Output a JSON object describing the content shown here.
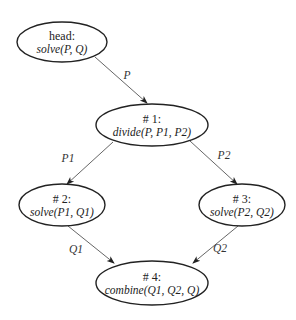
{
  "diagram": {
    "type": "flow-graph",
    "nodes": [
      {
        "id": "head",
        "title": "head:",
        "label": "solve(P, Q)",
        "cx": 62,
        "cy": 42,
        "rx": 45,
        "ry": 20
      },
      {
        "id": "n1",
        "title": "# 1:",
        "label": "divide(P, P1, P2)",
        "cx": 152,
        "cy": 125,
        "rx": 56,
        "ry": 21
      },
      {
        "id": "n2",
        "title": "# 2:",
        "label": "solve(P1, Q1)",
        "cx": 62,
        "cy": 205,
        "rx": 43,
        "ry": 21
      },
      {
        "id": "n3",
        "title": "# 3:",
        "label": "solve(P2, Q2)",
        "cx": 242,
        "cy": 205,
        "rx": 43,
        "ry": 21
      },
      {
        "id": "n4",
        "title": "# 4:",
        "label": "combine(Q1, Q2, Q)",
        "cx": 152,
        "cy": 283,
        "rx": 56,
        "ry": 22
      }
    ],
    "edges": [
      {
        "from": "head",
        "to": "n1",
        "label": "P",
        "x1": 95,
        "y1": 57,
        "x2": 147,
        "y2": 103,
        "lx": 127,
        "ly": 79
      },
      {
        "from": "n1",
        "to": "n2",
        "label": "P1",
        "x1": 113,
        "y1": 142,
        "x2": 67,
        "y2": 184,
        "lx": 68,
        "ly": 162
      },
      {
        "from": "n1",
        "to": "n3",
        "label": "P2",
        "x1": 190,
        "y1": 141,
        "x2": 237,
        "y2": 184,
        "lx": 224,
        "ly": 159
      },
      {
        "from": "n2",
        "to": "n4",
        "label": "Q1",
        "x1": 68,
        "y1": 226,
        "x2": 114,
        "y2": 263,
        "lx": 76,
        "ly": 253
      },
      {
        "from": "n3",
        "to": "n4",
        "label": "Q2",
        "x1": 238,
        "y1": 226,
        "x2": 193,
        "y2": 263,
        "lx": 220,
        "ly": 252
      }
    ]
  }
}
